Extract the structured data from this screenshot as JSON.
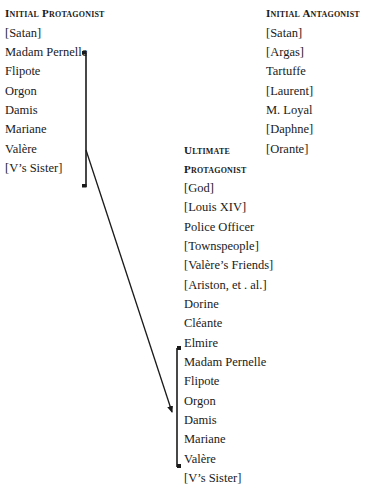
{
  "initial_protagonist": {
    "heading": "Initial Protagonist",
    "items": [
      "[Satan]",
      "Madam Pernelle",
      "Flipote",
      "Orgon",
      "Damis",
      "Mariane",
      "Valère",
      "[V’s Sister]"
    ]
  },
  "initial_antagonist": {
    "heading": "Initial Antagonist",
    "items": [
      "[Satan]",
      "[Argas]",
      "Tartuffe",
      "[Laurent]",
      "M. Loyal",
      "[Daphne]",
      "[Orante]"
    ]
  },
  "ultimate_protagonist": {
    "heading_line1": "Ultimate",
    "heading_line2": "Protagonist",
    "items": [
      "[God]",
      "[Louis XIV]",
      "Police Officer",
      "[Townspeople]",
      "[Valère’s Friends]",
      "[Ariston, et . al.]",
      "Dorine",
      "Cléante",
      "Elmire",
      "Madam Pernelle",
      "Flipote",
      "Orgon",
      "Damis",
      "Mariane",
      "Valère",
      "[V’s Sister]"
    ]
  },
  "connectors": {
    "left_bracket": {
      "x": 86,
      "y_top": 53,
      "y_bottom": 187
    },
    "right_bracket": {
      "x": 177,
      "y_top": 348,
      "y_bottom": 467
    },
    "arrow": {
      "from": [
        86,
        150
      ],
      "to": [
        173,
        413
      ]
    },
    "line_color": "#1a1a1a"
  }
}
